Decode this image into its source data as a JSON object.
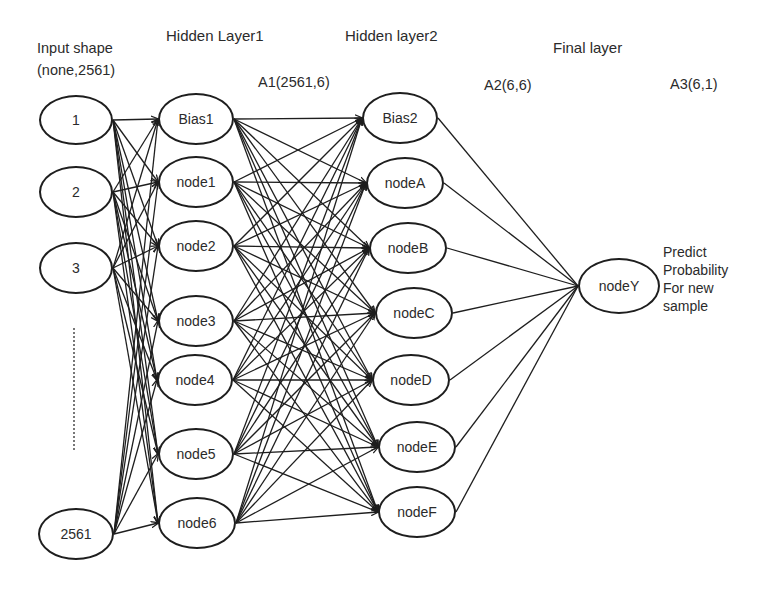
{
  "headers": {
    "input": [
      "Input shape",
      "(none,2561)"
    ],
    "hidden1": "Hidden Layer1",
    "hidden2": "Hidden layer2",
    "final": "Final layer",
    "a1": "A1(2561,6)",
    "a2": "A2(6,6)",
    "a3": "A3(6,1)"
  },
  "input_nodes": [
    {
      "label": "1",
      "cx": 76,
      "cy": 120,
      "rx": 37,
      "ry": 25
    },
    {
      "label": "2",
      "cx": 76,
      "cy": 192,
      "rx": 37,
      "ry": 26
    },
    {
      "label": "3",
      "cx": 76,
      "cy": 268,
      "rx": 37,
      "ry": 26
    },
    {
      "label": "2561",
      "cx": 76,
      "cy": 534,
      "rx": 38,
      "ry": 26
    }
  ],
  "hidden1_nodes": [
    {
      "label": "Bias1",
      "cx": 196,
      "cy": 119,
      "rx": 38,
      "ry": 26
    },
    {
      "label": "node1",
      "cx": 196,
      "cy": 182,
      "rx": 38,
      "ry": 26
    },
    {
      "label": "node2",
      "cx": 196,
      "cy": 246,
      "rx": 38,
      "ry": 26
    },
    {
      "label": "node3",
      "cx": 196,
      "cy": 321,
      "rx": 38,
      "ry": 26
    },
    {
      "label": "node4",
      "cx": 195,
      "cy": 380,
      "rx": 38,
      "ry": 26
    },
    {
      "label": "node5",
      "cx": 196,
      "cy": 454,
      "rx": 38,
      "ry": 26
    },
    {
      "label": "node6",
      "cx": 197,
      "cy": 523,
      "rx": 39,
      "ry": 26
    }
  ],
  "hidden2_nodes": [
    {
      "label": "Bias2",
      "cx": 400,
      "cy": 118,
      "rx": 38,
      "ry": 26
    },
    {
      "label": "nodeA",
      "cx": 405,
      "cy": 183,
      "rx": 39,
      "ry": 26
    },
    {
      "label": "nodeB",
      "cx": 408,
      "cy": 248,
      "rx": 39,
      "ry": 26
    },
    {
      "label": "nodeC",
      "cx": 414,
      "cy": 313,
      "rx": 39,
      "ry": 26
    },
    {
      "label": "nodeD",
      "cx": 411,
      "cy": 380,
      "rx": 39,
      "ry": 26
    },
    {
      "label": "nodeE",
      "cx": 417,
      "cy": 447,
      "rx": 39,
      "ry": 26
    },
    {
      "label": "nodeF",
      "cx": 417,
      "cy": 512,
      "rx": 39,
      "ry": 26
    }
  ],
  "output_node": {
    "label": "nodeY",
    "cx": 619,
    "cy": 286,
    "rx": 41,
    "ry": 28
  },
  "prediction_text": [
    "Predict",
    "Probability",
    "For new",
    "sample"
  ],
  "ellipsis_marker": "vertical-dotted-line",
  "edge_color": "#1e1e1e"
}
